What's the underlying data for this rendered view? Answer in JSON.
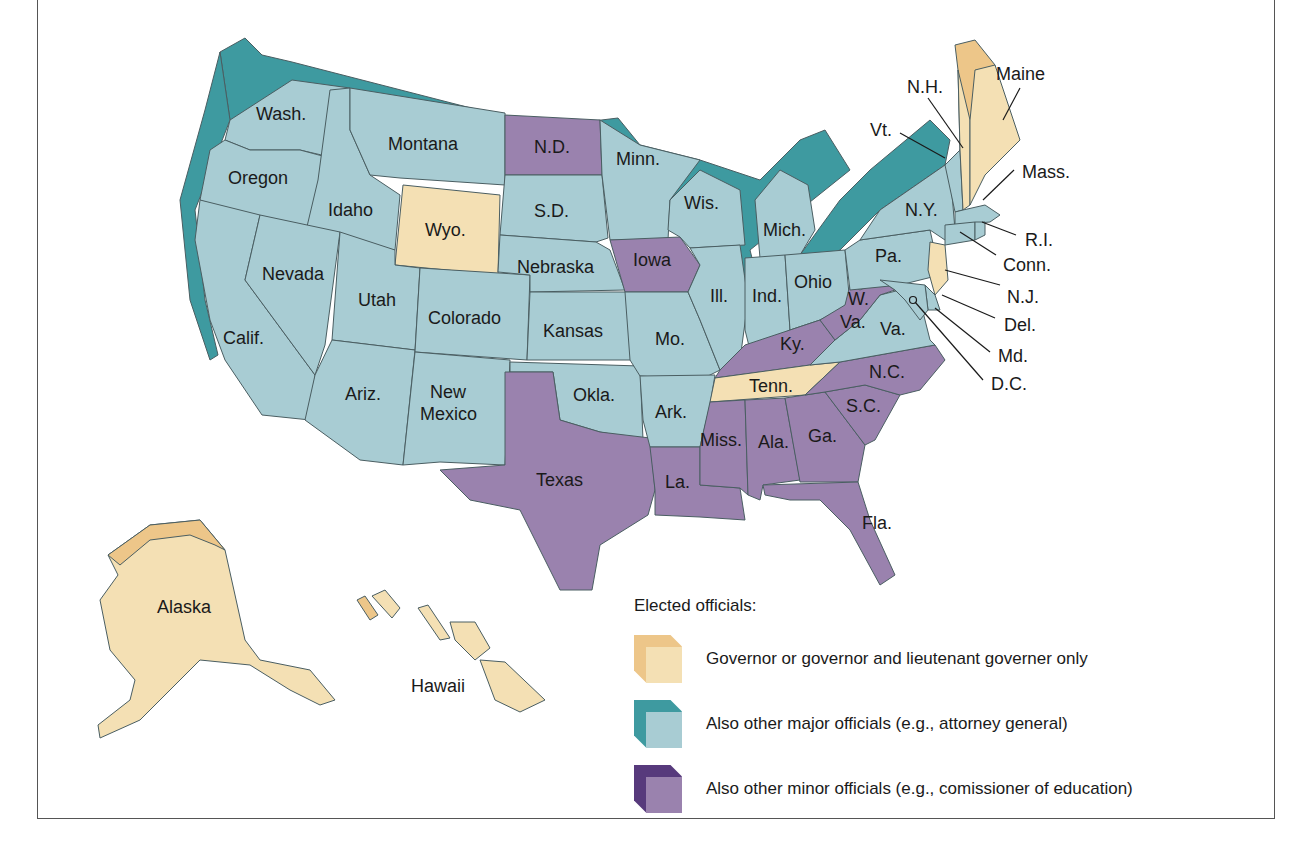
{
  "colors": {
    "governor_only": {
      "front": "#F4E0B4",
      "top": "#EDC689"
    },
    "major_officials": {
      "front": "#A8CCD3",
      "top": "#3E9AA0"
    },
    "minor_officials": {
      "front": "#9A82AE",
      "top": "#573A7C"
    }
  },
  "legend": {
    "title": "Elected officials:",
    "items": [
      {
        "key": "governor_only",
        "label": "Governor or governor and lieutenant governer only"
      },
      {
        "key": "major_officials",
        "label": "Also other major officials (e.g., attorney general)"
      },
      {
        "key": "minor_officials",
        "label": "Also other minor officials (e.g., comissioner of education)"
      }
    ]
  },
  "states": {
    "wash": {
      "label": "Wash.",
      "category": "major_officials"
    },
    "oregon": {
      "label": "Oregon",
      "category": "major_officials"
    },
    "calif": {
      "label": "Calif.",
      "category": "major_officials"
    },
    "idaho": {
      "label": "Idaho",
      "category": "major_officials"
    },
    "nevada": {
      "label": "Nevada",
      "category": "major_officials"
    },
    "montana": {
      "label": "Montana",
      "category": "major_officials"
    },
    "wyo": {
      "label": "Wyo.",
      "category": "governor_only"
    },
    "utah": {
      "label": "Utah",
      "category": "major_officials"
    },
    "ariz": {
      "label": "Ariz.",
      "category": "major_officials"
    },
    "colorado": {
      "label": "Colorado",
      "category": "major_officials"
    },
    "new_mexico": {
      "label_1": "New",
      "label_2": "Mexico",
      "category": "major_officials"
    },
    "nd": {
      "label": "N.D.",
      "category": "minor_officials"
    },
    "sd": {
      "label": "S.D.",
      "category": "major_officials"
    },
    "nebraska": {
      "label": "Nebraska",
      "category": "major_officials"
    },
    "kansas": {
      "label": "Kansas",
      "category": "major_officials"
    },
    "okla": {
      "label": "Okla.",
      "category": "major_officials"
    },
    "texas": {
      "label": "Texas",
      "category": "minor_officials"
    },
    "minn": {
      "label": "Minn.",
      "category": "major_officials"
    },
    "iowa": {
      "label": "Iowa",
      "category": "minor_officials"
    },
    "mo": {
      "label": "Mo.",
      "category": "major_officials"
    },
    "ark": {
      "label": "Ark.",
      "category": "major_officials"
    },
    "la": {
      "label": "La.",
      "category": "minor_officials"
    },
    "wis": {
      "label": "Wis.",
      "category": "major_officials"
    },
    "ill": {
      "label": "Ill.",
      "category": "major_officials"
    },
    "mich": {
      "label": "Mich.",
      "category": "major_officials"
    },
    "ind": {
      "label": "Ind.",
      "category": "major_officials"
    },
    "ohio": {
      "label": "Ohio",
      "category": "major_officials"
    },
    "ky": {
      "label": "Ky.",
      "category": "minor_officials"
    },
    "tenn": {
      "label": "Tenn.",
      "category": "governor_only"
    },
    "miss": {
      "label": "Miss.",
      "category": "minor_officials"
    },
    "ala": {
      "label": "Ala.",
      "category": "minor_officials"
    },
    "ga": {
      "label": "Ga.",
      "category": "minor_officials"
    },
    "fla": {
      "label": "Fla.",
      "category": "minor_officials"
    },
    "sc": {
      "label": "S.C.",
      "category": "minor_officials"
    },
    "nc": {
      "label": "N.C.",
      "category": "minor_officials"
    },
    "va": {
      "label": "Va.",
      "category": "major_officials"
    },
    "wva": {
      "label_1": "W.",
      "label_2": "Va.",
      "category": "minor_officials"
    },
    "pa": {
      "label": "Pa.",
      "category": "major_officials"
    },
    "ny": {
      "label": "N.Y.",
      "category": "major_officials"
    },
    "vt": {
      "label": "Vt.",
      "category": "major_officials"
    },
    "nh": {
      "label": "N.H.",
      "category": "governor_only"
    },
    "maine": {
      "label": "Maine",
      "category": "governor_only"
    },
    "mass": {
      "label": "Mass.",
      "category": "major_officials"
    },
    "ri": {
      "label": "R.I.",
      "category": "major_officials"
    },
    "conn": {
      "label": "Conn.",
      "category": "major_officials"
    },
    "nj": {
      "label": "N.J.",
      "category": "governor_only"
    },
    "del": {
      "label": "Del.",
      "category": "major_officials"
    },
    "md": {
      "label": "Md.",
      "category": "major_officials"
    },
    "dc": {
      "label": "D.C.",
      "category": "major_officials"
    },
    "alaska": {
      "label": "Alaska",
      "category": "governor_only"
    },
    "hawaii": {
      "label": "Hawaii",
      "category": "governor_only"
    }
  }
}
